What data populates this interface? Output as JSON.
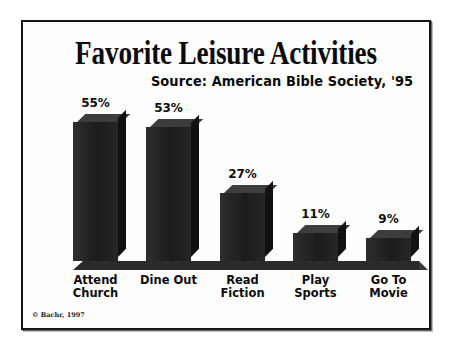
{
  "frame": {
    "border_color": "#151515",
    "background": "#fdfdfd"
  },
  "credit": "© Bachr, 1997",
  "chart_data": {
    "type": "bar",
    "title": "Favorite Leisure Activities",
    "subtitle": "Source: American Bible Society, '95",
    "xlabel": "",
    "ylabel": "",
    "ylim": [
      0,
      60
    ],
    "grid": false,
    "legend": "none",
    "style": "3d-bars-monochrome",
    "bar_color": "#232323",
    "categories": [
      "Attend Church",
      "Dine Out",
      "Read Fiction",
      "Play Sports",
      "Go To Movie"
    ],
    "category_lines": [
      [
        "Attend",
        "Church"
      ],
      [
        "Dine Out",
        ""
      ],
      [
        "Read",
        "Fiction"
      ],
      [
        "Play",
        "Sports"
      ],
      [
        "Go To",
        "Movie"
      ]
    ],
    "values": [
      55,
      53,
      27,
      11,
      9
    ],
    "value_labels": [
      "55%",
      "53%",
      "27%",
      "11%",
      "9%"
    ]
  }
}
